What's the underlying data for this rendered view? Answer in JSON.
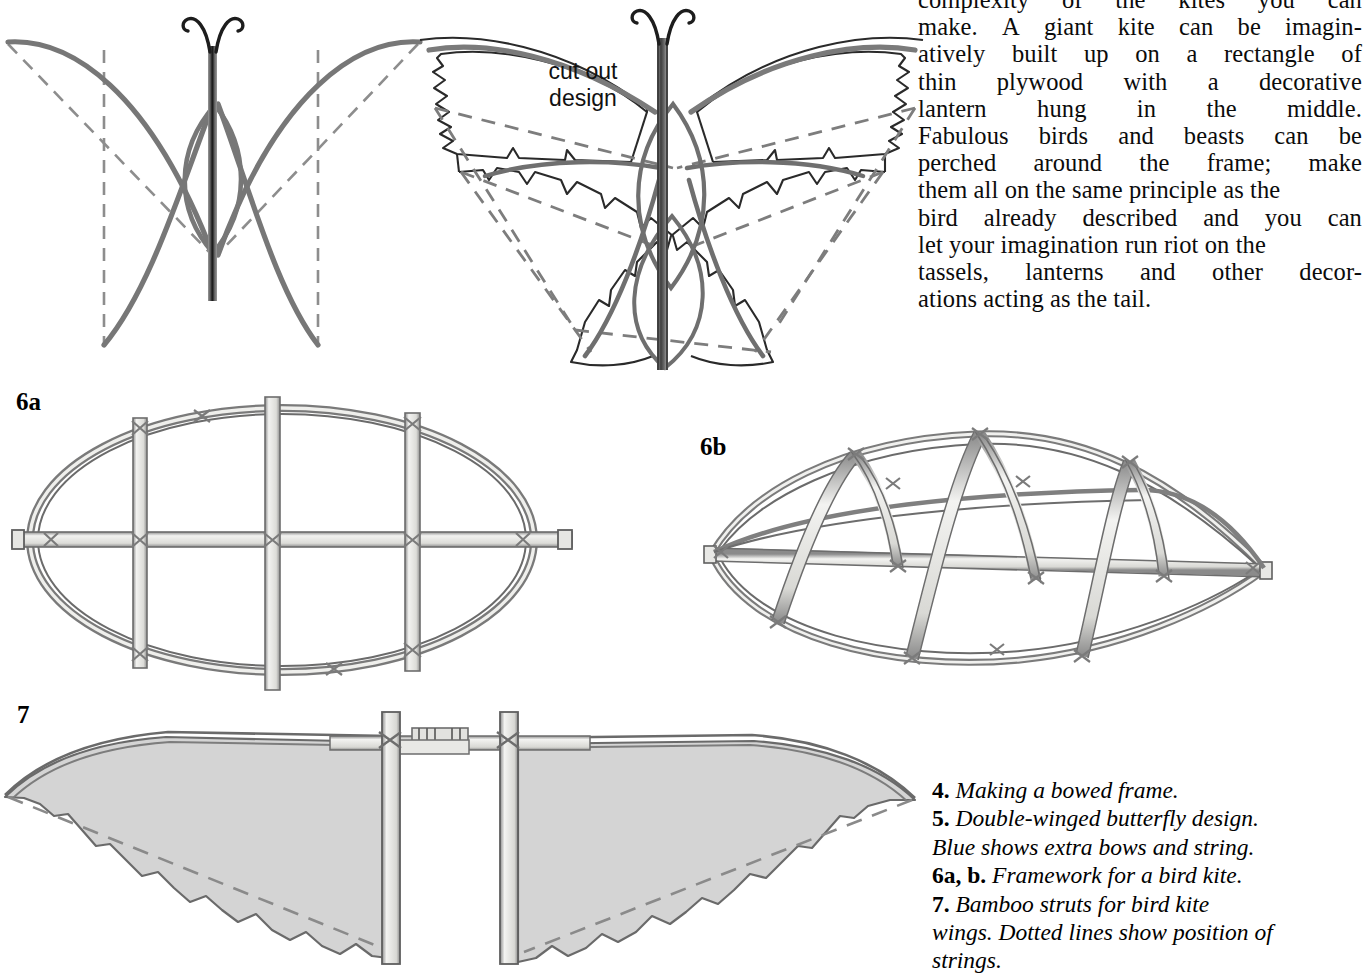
{
  "page": {
    "background_color": "#ffffff",
    "width": 1356,
    "height": 973
  },
  "body_text": {
    "lines": [
      "complexity of the kites you can",
      "make. A giant kite can be imagin-",
      "atively built up on a rectangle of",
      "thin plywood with a decorative",
      "lantern hung in the middle.",
      "Fabulous birds and beasts can be",
      "perched around the frame; make",
      "them all on the same principle as the",
      "bird already described and you can",
      "let your imagination run riot on the",
      "tassels, lanterns and other decor-",
      "ations acting as the tail."
    ],
    "justified_words": [
      [
        "complexity",
        "of",
        "the",
        "kites",
        "you",
        "can"
      ],
      [
        "make.",
        "A",
        "giant",
        "kite",
        "can",
        "be",
        "imagin-"
      ],
      [
        "atively",
        "built",
        "up",
        "on",
        "a",
        "rectangle",
        "of"
      ],
      [
        "thin",
        "plywood",
        "with",
        "a",
        "decorative"
      ],
      [
        "lantern",
        "hung",
        "in",
        "the",
        "middle."
      ],
      [
        "Fabulous",
        "birds",
        "and",
        "beasts",
        "can",
        "be"
      ],
      [
        "perched",
        "around",
        "the",
        "frame;",
        "make"
      ],
      [
        "them all on the same principle as the"
      ],
      [
        "bird",
        "already",
        "described",
        "and",
        "you",
        "can"
      ],
      [
        "let your imagination run riot on the"
      ],
      [
        "tassels,",
        "lanterns",
        "and",
        "other",
        "decor-"
      ],
      [
        "ations acting as the tail."
      ]
    ]
  },
  "caption": {
    "entries": [
      {
        "number": "4.",
        "text": "Making a bowed frame."
      },
      {
        "number": "5.",
        "text": "Double-winged butterfly design."
      },
      {
        "number": "",
        "text": "Blue shows extra bows and string."
      },
      {
        "number": "6a, b.",
        "text": "Framework for a bird kite."
      },
      {
        "number": "7.",
        "text": "Bamboo struts for bird kite"
      },
      {
        "number": "",
        "text": "wings. Dotted lines show position of"
      },
      {
        "number": "",
        "text": "strings."
      }
    ]
  },
  "figure_labels": {
    "fig6a": "6a",
    "fig6b": "6b",
    "fig7": "7"
  },
  "annotations": {
    "cut_out_line1": "cut out",
    "cut_out_line2": "design"
  },
  "colors": {
    "ink_dark": "#1a1a1a",
    "ink_grey": "#6f6f6f",
    "ink_mid": "#8a8a8a",
    "wash_fill": "#d3d3d3",
    "bamboo_fill": "#e3e3e0",
    "paper": "#ffffff"
  },
  "figures": [
    {
      "id": "fig5a",
      "name": "single-winged-butterfly-kite",
      "description": "Butterfly kite frame: two bowed wing spars crossing a vertical spine, dashed outline of the paper sail, curled antennae at the top."
    },
    {
      "id": "fig5b",
      "name": "double-winged-butterfly-kite",
      "description": "Double-winged butterfly design with scalloped cut-out wing edges, extra bows and string shown, curled antennae."
    },
    {
      "id": "fig6a",
      "name": "bird-kite-framework-flat",
      "description": "Flat elliptical bamboo framework with one long horizontal spine and three vertical cross struts lashed at each intersection."
    },
    {
      "id": "fig6b",
      "name": "bird-kite-framework-bowed",
      "description": "Same elliptical framework shown in perspective, bowed so the three cross struts arch upwards."
    },
    {
      "id": "fig7",
      "name": "bamboo-struts-bird-kite-wings",
      "description": "Pair of scallop-edged bird kite wings hung on two vertical bamboo struts joined by a lashed horizontal crossbar; dashed lines show the string positions."
    }
  ]
}
